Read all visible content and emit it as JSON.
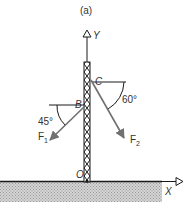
{
  "figure": {
    "caption": "(a)",
    "axes": {
      "y_label": "Y",
      "x_label": "X",
      "origin_label": "O"
    },
    "points": {
      "B": "B",
      "C": "C"
    },
    "forces": [
      {
        "name": "F",
        "subscript": "1",
        "angle_label": "45°",
        "from_point": "B"
      },
      {
        "name": "F",
        "subscript": "2",
        "angle_label": "60°",
        "from_point": "C"
      }
    ],
    "colors": {
      "force_arrow": "#707070",
      "lines": "#1a1a1a",
      "ground_fill": "#c8c8c8"
    }
  }
}
